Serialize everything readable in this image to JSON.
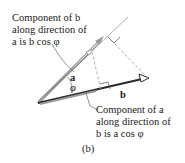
{
  "figure": {
    "caption": "(b)",
    "vector_a_label": "a",
    "vector_b_label": "b",
    "angle_label": "φ",
    "callout_top": {
      "line1": "Component of b",
      "line2": "along direction of",
      "line3": "a is b cos φ"
    },
    "callout_bottom": {
      "line1": "Component of a",
      "line2": "along direction of",
      "line3": "b is a cos φ"
    },
    "colors": {
      "vector_b": "#2a2a2a",
      "vector_a": "#9a9a9a",
      "dashed": "#999999"
    }
  }
}
